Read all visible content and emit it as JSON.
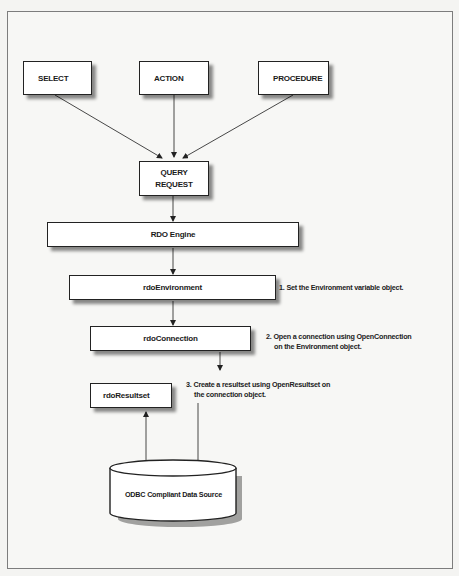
{
  "diagram": {
    "type": "flowchart",
    "query_types": [
      {
        "label": "SELECT"
      },
      {
        "label": "ACTION"
      },
      {
        "label": "PROCEDURE"
      }
    ],
    "query_request": {
      "line1": "QUERY",
      "line2": "REQUEST"
    },
    "rdo_engine": {
      "label": "RDO Engine"
    },
    "rdo_environment": {
      "label": "rdoEnvironment"
    },
    "rdo_connection": {
      "label": "rdoConnection"
    },
    "rdo_resultset": {
      "label": "rdoResultset"
    },
    "data_source": {
      "label": "ODBC Compliant Data Source"
    },
    "notes": [
      {
        "line1": "1. Set the Environment variable object."
      },
      {
        "line1": "2. Open a connection using OpenConnection",
        "line2": "on the Environment object."
      },
      {
        "line1": "3. Create a resultset using OpenResultset on",
        "line2": "the connection object."
      }
    ],
    "colors": {
      "stroke": "#222222",
      "box_fill": "#ffffff",
      "background": "#f4f4f2",
      "frame": "#7d7d7d"
    }
  }
}
